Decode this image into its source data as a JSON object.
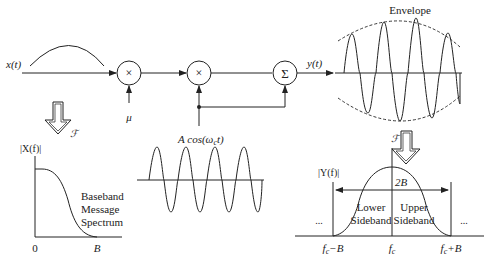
{
  "diagram": {
    "input_label": "x(t)",
    "output_label": "y(t)",
    "mixer1_symbol": "×",
    "mixer2_symbol": "×",
    "summer_symbol": "Σ",
    "mu_label": "μ",
    "carrier_label": "A cos(ω",
    "carrier_sub": "c",
    "carrier_tail": "t)",
    "envelope_label": "Envelope",
    "fourier_label_left": "ℱ",
    "fourier_label_right": "ℱ"
  },
  "baseband_plot": {
    "ylabel": "|X(f)|",
    "x_ticks": [
      "0",
      "B"
    ],
    "caption_lines": [
      "Baseband",
      "Message",
      "Spectrum"
    ]
  },
  "modulated_plot": {
    "ylabel": "|Y(f)|",
    "bandwidth_label": "2B",
    "lower_sideband": [
      "Lower",
      "Sideband"
    ],
    "upper_sideband": [
      "Upper",
      "Sideband"
    ],
    "ellipsis_left": "...",
    "ellipsis_right": "...",
    "x_ticks": [
      "f_c−B",
      "f_c",
      "f_c+B"
    ],
    "tick_fc_minus_b_main": "f",
    "tick_fc_minus_b_sub": "c",
    "tick_fc_minus_b_tail": "−B",
    "tick_fc_main": "f",
    "tick_fc_sub": "c",
    "tick_fc_plus_b_main": "f",
    "tick_fc_plus_b_sub": "c",
    "tick_fc_plus_b_tail": "+B"
  }
}
